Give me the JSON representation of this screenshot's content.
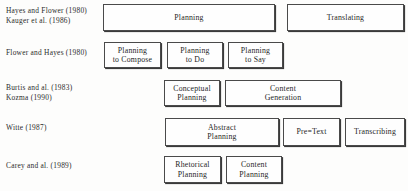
{
  "diagram": {
    "type": "comparison-matrix",
    "colors": {
      "background": "#fdfdfc",
      "box_fill": "#fefefe",
      "box_border": "#4a4a4a",
      "box_shadow": "#3a3a3a",
      "text": "#262626",
      "label_text": "#2b2b2b"
    },
    "rows": [
      {
        "id": "row-1",
        "label_lines": [
          "Hayes and Flower (1980)",
          "Kauger et al. (1986)"
        ],
        "boxes": [
          {
            "id": "planning",
            "text": "Planning",
            "x": 103,
            "y": 4,
            "w": 172,
            "h": 27
          },
          {
            "id": "translating",
            "text": "Translating",
            "x": 287,
            "y": 4,
            "w": 117,
            "h": 27
          }
        ]
      },
      {
        "id": "row-2",
        "label_lines": [
          "Flower and Hayes (1980)"
        ],
        "boxes": [
          {
            "id": "planning-to-compose",
            "text": "Planning\nto Compose",
            "x": 104,
            "y": 42,
            "w": 57,
            "h": 26
          },
          {
            "id": "planning-to-do",
            "text": "Planning\nto Do",
            "x": 167,
            "y": 42,
            "w": 56,
            "h": 26
          },
          {
            "id": "planning-to-say",
            "text": "Planning\nto Say",
            "x": 228,
            "y": 42,
            "w": 55,
            "h": 26
          }
        ]
      },
      {
        "id": "row-3",
        "label_lines": [
          "Burtis and al. (1983)",
          "Kozma (1990)"
        ],
        "boxes": [
          {
            "id": "conceptual-planning",
            "text": "Conceptual\nPlanning",
            "x": 164,
            "y": 80,
            "w": 56,
            "h": 26
          },
          {
            "id": "content-generation",
            "text": "Content\nGeneration",
            "x": 225,
            "y": 80,
            "w": 116,
            "h": 26
          }
        ]
      },
      {
        "id": "row-4",
        "label_lines": [
          "Witte (1987)"
        ],
        "boxes": [
          {
            "id": "abstract-planning",
            "text": "Abstract\nPlanning",
            "x": 165,
            "y": 118,
            "w": 114,
            "h": 28
          },
          {
            "id": "pre-text",
            "text": "Pre=Text",
            "x": 283,
            "y": 118,
            "w": 57,
            "h": 28
          },
          {
            "id": "transcribing",
            "text": "Transcribing",
            "x": 345,
            "y": 118,
            "w": 60,
            "h": 28
          }
        ]
      },
      {
        "id": "row-5",
        "label_lines": [
          "Carey and al. (1989)"
        ],
        "boxes": [
          {
            "id": "rhetorical-planning",
            "text": "Rhetorical\nPlanning",
            "x": 164,
            "y": 156,
            "w": 57,
            "h": 27
          },
          {
            "id": "content-planning",
            "text": "Content\nPlanning",
            "x": 226,
            "y": 156,
            "w": 56,
            "h": 27
          }
        ]
      }
    ],
    "label_positions": [
      {
        "id": "row-1",
        "top": 6
      },
      {
        "id": "row-2",
        "top": 48
      },
      {
        "id": "row-3",
        "top": 83
      },
      {
        "id": "row-4",
        "top": 123
      },
      {
        "id": "row-5",
        "top": 161
      }
    ]
  }
}
